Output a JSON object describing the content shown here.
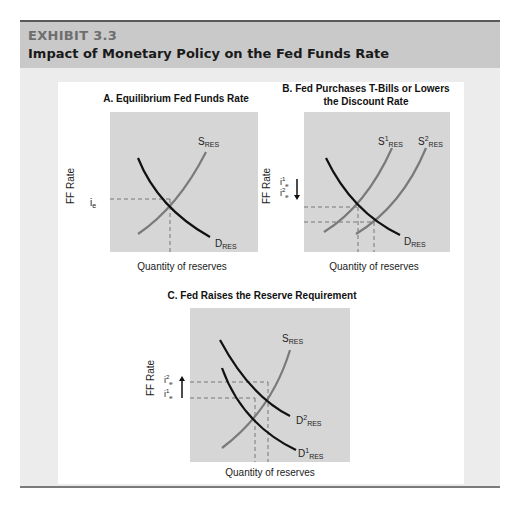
{
  "header": {
    "exhibit_label": "EXHIBIT 3.3",
    "title": "Impact of Monetary Policy on the Fed Funds Rate"
  },
  "panels": [
    {
      "title_line1": "A. Equilibrium Fed Funds Rate",
      "title_line2": "",
      "ylabel": "FF Rate",
      "xlabel": "Quantity of reserves",
      "rate_labels": [
        "i",
        "e"
      ],
      "supply": [
        "S",
        "RES"
      ],
      "demand": [
        "D",
        "RES"
      ]
    },
    {
      "title_line1": "B. Fed Purchases T-Bills or Lowers",
      "title_line2": "the Discount Rate",
      "ylabel": "FF Rate",
      "xlabel": "Quantity of reserves",
      "rate1": [
        "i",
        "1",
        "e"
      ],
      "rate2": [
        "i",
        "2",
        "e"
      ],
      "supply1": [
        "S",
        "1",
        "RES"
      ],
      "supply2": [
        "S",
        "2",
        "RES"
      ],
      "demand": [
        "D",
        "RES"
      ]
    },
    {
      "title_line1": "C. Fed Raises the Reserve Requirement",
      "title_line2": "",
      "ylabel": "FF Rate",
      "xlabel": "Quantity of reserves",
      "rate1": [
        "i",
        "1",
        "e"
      ],
      "rate2": [
        "i",
        "2",
        "e"
      ],
      "supply": [
        "S",
        "RES"
      ],
      "demand1": [
        "D",
        "1",
        "RES"
      ],
      "demand2": [
        "D",
        "2",
        "RES"
      ]
    }
  ],
  "colors": {
    "header_bg": "#c9c9c9",
    "panel_bg": "#ececec",
    "plot_bg": "#d6d6d6",
    "supply_curve": "#7a7a7a",
    "demand_curve": "#111111"
  }
}
